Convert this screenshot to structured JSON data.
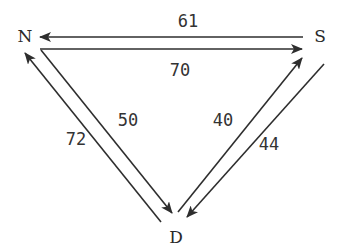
{
  "diagram": {
    "type": "directed-graph",
    "colors": {
      "line": "#2e2e2e",
      "text": "#2a2a2a",
      "background": "#ffffff"
    },
    "nodes": [
      {
        "id": "N",
        "label": "N",
        "x": 25,
        "y": 37
      },
      {
        "id": "S",
        "label": "S",
        "x": 320,
        "y": 37
      },
      {
        "id": "D",
        "label": "D",
        "x": 176,
        "y": 238
      }
    ],
    "edges": [
      {
        "from": "S",
        "to": "N",
        "label": "61",
        "x1": 303,
        "y1": 37,
        "x2": 40,
        "y2": 37,
        "lx": 188,
        "ly": 27
      },
      {
        "from": "N",
        "to": "S",
        "label": "70",
        "x1": 40,
        "y1": 49,
        "x2": 302,
        "y2": 49,
        "lx": 180,
        "ly": 76
      },
      {
        "from": "D",
        "to": "N",
        "label": "72",
        "x1": 161,
        "y1": 222,
        "x2": 25,
        "y2": 53,
        "lx": 76,
        "ly": 145
      },
      {
        "from": "N",
        "to": "D",
        "label": "50",
        "x1": 41,
        "y1": 50,
        "x2": 172,
        "y2": 213,
        "lx": 128,
        "ly": 126
      },
      {
        "from": "D",
        "to": "S",
        "label": "40",
        "x1": 178,
        "y1": 212,
        "x2": 302,
        "y2": 58,
        "lx": 223,
        "ly": 126
      },
      {
        "from": "S",
        "to": "D",
        "label": "44",
        "x1": 324,
        "y1": 64,
        "x2": 187,
        "y2": 217,
        "lx": 269,
        "ly": 150
      }
    ]
  }
}
